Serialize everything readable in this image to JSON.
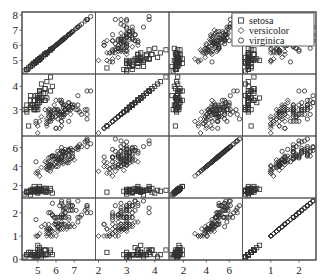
{
  "figure": {
    "type": "scatterplot-matrix",
    "background": "#ffffff",
    "frame_color": "#555555",
    "marker_color": "#333333"
  },
  "legend": {
    "position": "top-right",
    "entries": [
      {
        "label": "setosa",
        "marker": "square-marker"
      },
      {
        "label": "versicolor",
        "marker": "diamond-marker"
      },
      {
        "label": "virginica",
        "marker": "circle-marker"
      }
    ]
  },
  "axes": {
    "row_ticks": [
      {
        "row": 0,
        "values": [
          5,
          6,
          7,
          8
        ]
      },
      {
        "row": 1,
        "values": [
          3,
          4
        ]
      },
      {
        "row": 2,
        "values": [
          2,
          4,
          6
        ]
      },
      {
        "row": 3,
        "values": [
          0,
          1,
          2
        ]
      }
    ],
    "col_ticks": [
      {
        "col": 0,
        "values": [
          5,
          6,
          7
        ]
      },
      {
        "col": 1,
        "values": [
          2,
          3,
          4
        ]
      },
      {
        "col": 2,
        "values": [
          2,
          4,
          6
        ]
      },
      {
        "col": 3,
        "values": [
          1,
          2
        ]
      }
    ],
    "ranges": [
      {
        "var": "sepal-length",
        "min": 4.3,
        "max": 8.0
      },
      {
        "var": "sepal-width",
        "min": 2.0,
        "max": 4.4
      },
      {
        "var": "petal-length",
        "min": 1.0,
        "max": 6.9
      },
      {
        "var": "petal-width",
        "min": 0.1,
        "max": 2.5
      }
    ]
  },
  "chart_data": {
    "type": "scatter",
    "title": "",
    "xlabel": "",
    "ylabel": "",
    "variables": [
      "sepal length",
      "sepal width",
      "petal length",
      "petal width"
    ],
    "grid": false,
    "legend_position": "top-right",
    "axis_ranges": {
      "sepal length": [
        4.3,
        8.0
      ],
      "sepal width": [
        2.0,
        4.4
      ],
      "petal length": [
        1.0,
        6.9
      ],
      "petal width": [
        0.1,
        2.5
      ]
    },
    "series": [
      {
        "name": "setosa",
        "marker": "square",
        "sepal_length": [
          5.1,
          4.9,
          4.7,
          4.6,
          5.0,
          5.4,
          4.6,
          5.0,
          4.4,
          4.9,
          5.4,
          4.8,
          4.8,
          4.3,
          5.8,
          5.7,
          5.4,
          5.1,
          5.7,
          5.1,
          5.4,
          5.1,
          4.6,
          5.1,
          4.8,
          5.0,
          5.0,
          5.2,
          5.2,
          4.7,
          4.8,
          5.4,
          5.2,
          5.5,
          4.9,
          5.0,
          5.5,
          4.9,
          4.4,
          5.1,
          5.0,
          4.5,
          4.4,
          5.0,
          5.1,
          4.8,
          5.1,
          4.6,
          5.3,
          5.0
        ],
        "sepal_width": [
          3.5,
          3.0,
          3.2,
          3.1,
          3.6,
          3.9,
          3.4,
          3.4,
          2.9,
          3.1,
          3.7,
          3.4,
          3.0,
          3.0,
          4.0,
          4.4,
          3.9,
          3.5,
          3.8,
          3.8,
          3.4,
          3.7,
          3.6,
          3.3,
          3.4,
          3.0,
          3.4,
          3.5,
          3.4,
          3.2,
          3.1,
          3.4,
          4.1,
          4.2,
          3.1,
          3.2,
          3.5,
          3.6,
          3.0,
          3.4,
          3.5,
          2.3,
          3.2,
          3.5,
          3.8,
          3.0,
          3.8,
          3.2,
          3.7,
          3.3
        ],
        "petal_length": [
          1.4,
          1.4,
          1.3,
          1.5,
          1.4,
          1.7,
          1.4,
          1.5,
          1.4,
          1.5,
          1.5,
          1.6,
          1.4,
          1.1,
          1.2,
          1.5,
          1.3,
          1.4,
          1.7,
          1.5,
          1.7,
          1.5,
          1.0,
          1.7,
          1.9,
          1.6,
          1.6,
          1.5,
          1.4,
          1.6,
          1.6,
          1.5,
          1.5,
          1.4,
          1.5,
          1.2,
          1.3,
          1.4,
          1.3,
          1.5,
          1.3,
          1.3,
          1.3,
          1.6,
          1.9,
          1.4,
          1.6,
          1.4,
          1.5,
          1.4
        ],
        "petal_width": [
          0.2,
          0.2,
          0.2,
          0.2,
          0.2,
          0.4,
          0.3,
          0.2,
          0.2,
          0.1,
          0.2,
          0.2,
          0.1,
          0.1,
          0.2,
          0.4,
          0.4,
          0.3,
          0.3,
          0.3,
          0.2,
          0.4,
          0.2,
          0.5,
          0.2,
          0.2,
          0.4,
          0.2,
          0.2,
          0.2,
          0.2,
          0.4,
          0.1,
          0.2,
          0.2,
          0.2,
          0.2,
          0.1,
          0.2,
          0.2,
          0.3,
          0.3,
          0.2,
          0.6,
          0.4,
          0.3,
          0.2,
          0.2,
          0.2,
          0.2
        ]
      },
      {
        "name": "versicolor",
        "marker": "diamond",
        "sepal_length": [
          7.0,
          6.4,
          6.9,
          5.5,
          6.5,
          5.7,
          6.3,
          4.9,
          6.6,
          5.2,
          5.0,
          5.9,
          6.0,
          6.1,
          5.6,
          6.7,
          5.6,
          5.8,
          6.2,
          5.6,
          5.9,
          6.1,
          6.3,
          6.1,
          6.4,
          6.6,
          6.8,
          6.7,
          6.0,
          5.7,
          5.5,
          5.5,
          5.8,
          6.0,
          5.4,
          6.0,
          6.7,
          6.3,
          5.6,
          5.5,
          5.5,
          6.1,
          5.8,
          5.0,
          5.6,
          5.7,
          5.7,
          6.2,
          5.1,
          5.7
        ],
        "sepal_width": [
          3.2,
          3.2,
          3.1,
          2.3,
          2.8,
          2.8,
          3.3,
          2.4,
          2.9,
          2.7,
          2.0,
          3.0,
          2.2,
          2.9,
          2.9,
          3.1,
          3.0,
          2.7,
          2.2,
          2.5,
          3.2,
          2.8,
          2.5,
          2.8,
          2.9,
          3.0,
          2.8,
          3.0,
          2.9,
          2.6,
          2.4,
          2.4,
          2.7,
          2.7,
          3.0,
          3.4,
          3.1,
          2.3,
          3.0,
          2.5,
          2.6,
          3.0,
          2.6,
          2.3,
          2.7,
          3.0,
          2.9,
          2.9,
          2.5,
          2.8
        ],
        "petal_length": [
          4.7,
          4.5,
          4.9,
          4.0,
          4.6,
          4.5,
          4.7,
          3.3,
          4.6,
          3.9,
          3.5,
          4.2,
          4.0,
          4.7,
          3.6,
          4.4,
          4.5,
          4.1,
          4.5,
          3.9,
          4.8,
          4.0,
          4.9,
          4.7,
          4.3,
          4.4,
          4.8,
          5.0,
          4.5,
          3.5,
          3.8,
          3.7,
          3.9,
          5.1,
          4.5,
          4.5,
          4.7,
          4.4,
          4.1,
          4.0,
          4.4,
          4.6,
          4.0,
          3.3,
          4.2,
          4.2,
          4.2,
          4.3,
          3.0,
          4.1
        ],
        "petal_width": [
          1.4,
          1.5,
          1.5,
          1.3,
          1.5,
          1.3,
          1.6,
          1.0,
          1.3,
          1.4,
          1.0,
          1.5,
          1.0,
          1.4,
          1.3,
          1.4,
          1.5,
          1.0,
          1.5,
          1.1,
          1.8,
          1.3,
          1.5,
          1.2,
          1.3,
          1.4,
          1.4,
          1.7,
          1.5,
          1.0,
          1.1,
          1.0,
          1.2,
          1.6,
          1.5,
          1.6,
          1.5,
          1.3,
          1.3,
          1.3,
          1.2,
          1.4,
          1.2,
          1.0,
          1.3,
          1.2,
          1.3,
          1.3,
          1.1,
          1.3
        ]
      },
      {
        "name": "virginica",
        "marker": "circle",
        "sepal_length": [
          6.3,
          5.8,
          7.1,
          6.3,
          6.5,
          7.6,
          4.9,
          7.3,
          6.7,
          7.2,
          6.5,
          6.4,
          6.8,
          5.7,
          5.8,
          6.4,
          6.5,
          7.7,
          7.7,
          6.0,
          6.9,
          5.6,
          7.7,
          6.3,
          6.7,
          7.2,
          6.2,
          6.1,
          6.4,
          7.2,
          7.4,
          7.9,
          6.4,
          6.3,
          6.1,
          7.7,
          6.3,
          6.4,
          6.0,
          6.9,
          6.7,
          6.9,
          5.8,
          6.8,
          6.7,
          6.7,
          6.3,
          6.5,
          6.2,
          5.9
        ],
        "sepal_width": [
          3.3,
          2.7,
          3.0,
          2.9,
          3.0,
          3.0,
          2.5,
          2.9,
          2.5,
          3.6,
          3.2,
          2.7,
          3.0,
          2.5,
          2.8,
          3.2,
          3.0,
          3.8,
          2.6,
          2.2,
          3.2,
          2.8,
          2.8,
          2.7,
          3.3,
          3.2,
          2.8,
          3.0,
          2.8,
          3.0,
          2.8,
          3.8,
          2.8,
          2.8,
          2.6,
          3.0,
          3.4,
          3.1,
          3.0,
          3.1,
          3.1,
          3.1,
          2.7,
          3.2,
          3.3,
          3.0,
          2.5,
          3.0,
          3.4,
          3.0
        ],
        "petal_length": [
          6.0,
          5.1,
          5.9,
          5.6,
          5.8,
          6.6,
          4.5,
          6.3,
          5.8,
          6.1,
          5.1,
          5.3,
          5.5,
          5.0,
          5.1,
          5.3,
          5.5,
          6.7,
          6.9,
          5.0,
          5.7,
          4.9,
          6.7,
          4.9,
          5.7,
          6.0,
          4.8,
          4.9,
          5.6,
          5.8,
          6.1,
          6.4,
          5.6,
          5.1,
          5.6,
          6.1,
          5.6,
          5.5,
          4.8,
          5.4,
          5.6,
          5.1,
          5.1,
          5.9,
          5.7,
          5.2,
          5.0,
          5.2,
          5.4,
          5.1
        ],
        "petal_width": [
          2.5,
          1.9,
          2.1,
          1.8,
          2.2,
          2.1,
          1.7,
          1.8,
          1.8,
          2.5,
          2.0,
          1.9,
          2.1,
          2.0,
          2.4,
          2.3,
          1.8,
          2.2,
          2.3,
          1.5,
          2.3,
          2.0,
          2.0,
          1.8,
          2.1,
          1.8,
          1.8,
          1.8,
          2.1,
          1.6,
          1.9,
          2.0,
          2.2,
          1.5,
          1.4,
          2.3,
          2.4,
          1.8,
          1.8,
          2.1,
          2.4,
          2.3,
          1.9,
          2.3,
          2.5,
          2.3,
          1.9,
          2.0,
          2.3,
          1.8
        ]
      }
    ]
  }
}
